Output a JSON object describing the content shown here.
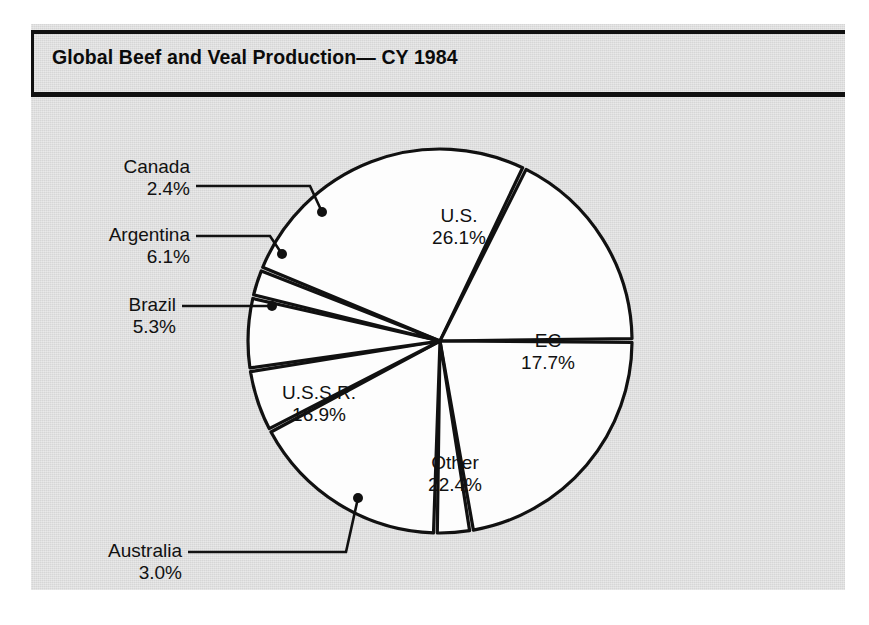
{
  "figure": {
    "title": "Global Beef and Veal Production— CY 1984",
    "background_color": "#d6d6d6",
    "line_color": "#111111",
    "slice_fill_color": "#fdfdfd"
  },
  "chart_data": {
    "type": "pie",
    "title": "Global Beef and Veal Production— CY 1984",
    "xlabel": "",
    "ylabel": "",
    "units": "percent of global production",
    "legend": "none (direct slice labels with leader lines)",
    "grid": false,
    "categories": [
      "U.S.",
      "EC",
      "Other",
      "Australia",
      "U.S.S.R.",
      "Brazil",
      "Argentina",
      "Canada"
    ],
    "values": [
      26.1,
      17.7,
      22.4,
      3.0,
      16.9,
      5.3,
      6.1,
      2.4
    ],
    "value_labels": [
      "26.1%",
      "17.7%",
      "22.4%",
      "3.0%",
      "16.9%",
      "5.3%",
      "6.1%",
      "2.4%"
    ],
    "total": 99.9,
    "slices": [
      {
        "name": "U.S.",
        "value": 26.1,
        "label": "U.S.",
        "value_label": "26.1%",
        "label_placement": "inside"
      },
      {
        "name": "EC",
        "value": 17.7,
        "label": "EC",
        "value_label": "17.7%",
        "label_placement": "inside"
      },
      {
        "name": "Other",
        "value": 22.4,
        "label": "Other",
        "value_label": "22.4%",
        "label_placement": "inside"
      },
      {
        "name": "Australia",
        "value": 3.0,
        "label": "Australia",
        "value_label": "3.0%",
        "label_placement": "outside-leader"
      },
      {
        "name": "U.S.S.R.",
        "value": 16.9,
        "label": "U.S.S.R.",
        "value_label": "16.9%",
        "label_placement": "inside"
      },
      {
        "name": "Brazil",
        "value": 5.3,
        "label": "Brazil",
        "value_label": "5.3%",
        "label_placement": "outside-leader"
      },
      {
        "name": "Argentina",
        "value": 6.1,
        "label": "Argentina",
        "value_label": "6.1%",
        "label_placement": "outside-leader"
      },
      {
        "name": "Canada",
        "value": 2.4,
        "label": "Canada",
        "value_label": "2.4%",
        "label_placement": "outside-leader"
      }
    ]
  },
  "labels": {
    "canada": {
      "name": "Canada",
      "pct": "2.4%"
    },
    "argentina": {
      "name": "Argentina",
      "pct": "6.1%"
    },
    "brazil": {
      "name": "Brazil",
      "pct": "5.3%"
    },
    "australia": {
      "name": "Australia",
      "pct": "3.0%"
    },
    "us": {
      "name": "U.S.",
      "pct": "26.1%"
    },
    "ec": {
      "name": "EC",
      "pct": "17.7%"
    },
    "other": {
      "name": "Other",
      "pct": "22.4%"
    },
    "ussr": {
      "name": "U.S.S.R.",
      "pct": "16.9%"
    }
  }
}
